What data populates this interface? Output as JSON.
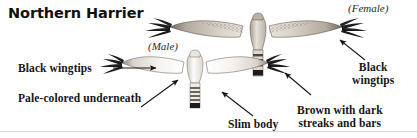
{
  "page": {
    "title": "Northern Harrier",
    "background_color": "#ffffff",
    "ink_color": "#161616",
    "rule_color": "#d9d9d9"
  },
  "sex_labels": {
    "male": "(Male)",
    "female": "(Female)"
  },
  "callouts": {
    "black_wingtips_left": "Black wingtips",
    "pale_colored_underneath": "Pale-colored underneath",
    "slim_body": "Slim body",
    "black_wingtips_right_line1": "Black",
    "black_wingtips_right_line2": "wingtips",
    "brown_streaks_line1": "Brown with dark",
    "brown_streaks_line2": "streaks and bars"
  },
  "illustrations": [
    {
      "name": "male-northern-harrier",
      "sex": "Male",
      "plumage": "Pale-colored underneath, white body and underwings",
      "wingtips": "Black",
      "tail": "Banded with dark terminal band",
      "body_color": "#f4f2ef",
      "wingtip_color": "#1c1c1c"
    },
    {
      "name": "female-northern-harrier",
      "sex": "Female",
      "plumage": "Brown with dark streaks and bars",
      "wingtips": "Black",
      "tail": "Brown with dark bars",
      "body_color": "#cfc7bb",
      "wingtip_color": "#1c1c1c"
    }
  ],
  "arrows": [
    {
      "name": "arrow-black-wingtips-left",
      "from": "Black wingtips",
      "to": "male left wingtip",
      "style": "straight-horizontal"
    },
    {
      "name": "arrow-pale-underneath",
      "from": "Pale-colored underneath",
      "to": "male left underwing",
      "style": "diagonal-up-right"
    },
    {
      "name": "arrow-slim-body",
      "from": "Slim body",
      "to": "male tail/body",
      "style": "diagonal-up-left"
    },
    {
      "name": "arrow-black-wingtips-right",
      "from": "Black wingtips",
      "to": "female right wingtip",
      "style": "diagonal-up-left"
    },
    {
      "name": "arrow-brown-streaks",
      "from": "Brown with dark streaks and bars",
      "to": "female tail",
      "style": "diagonal-up-left"
    }
  ]
}
